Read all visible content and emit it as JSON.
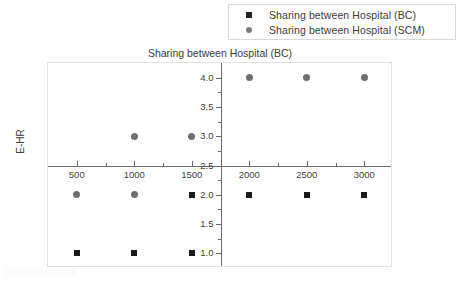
{
  "figure": {
    "title": "Sharing between Hospital (BC)",
    "y_axis_label": "E-HR"
  },
  "legend": {
    "entries": [
      {
        "label": "Sharing between Hospital (BC)",
        "marker": "square-marker-icon",
        "color": "#222222"
      },
      {
        "label": "Sharing between Hospital  (SCM)",
        "marker": "circle-marker-icon",
        "color": "#7d7d7d"
      }
    ]
  },
  "axes": {
    "x_tick_labels": [
      "500",
      "1000",
      "1500",
      "2000",
      "2500",
      "3000"
    ],
    "y_tick_labels": [
      "1.0",
      "1.5",
      "2.0",
      "2.5",
      "3.0",
      "3.5",
      "4.0"
    ]
  },
  "chart_data": {
    "type": "scatter",
    "title": "Sharing between Hospital (BC)",
    "xlabel": "",
    "ylabel": "E-HR",
    "xlim": [
      250,
      3250
    ],
    "ylim": [
      0.75,
      4.25
    ],
    "xticks": [
      500,
      1000,
      1500,
      2000,
      2500,
      3000
    ],
    "yticks": [
      1.0,
      1.5,
      2.0,
      2.5,
      3.0,
      3.5,
      4.0
    ],
    "grid": false,
    "legend_position": "top-right-outside",
    "spine_cross_x": 1750,
    "spine_cross_y": 2.5,
    "series": [
      {
        "name": "Sharing between Hospital (BC)",
        "marker": "square",
        "color": "#1a1a1a",
        "points": [
          {
            "x": 500,
            "y": 1.0
          },
          {
            "x": 1000,
            "y": 1.0
          },
          {
            "x": 1500,
            "y": 1.0
          },
          {
            "x": 1500,
            "y": 2.0
          },
          {
            "x": 2000,
            "y": 2.0
          },
          {
            "x": 2500,
            "y": 2.0
          },
          {
            "x": 3000,
            "y": 2.0
          }
        ]
      },
      {
        "name": "Sharing between Hospital  (SCM)",
        "marker": "circle",
        "color": "#6f6f6f",
        "points": [
          {
            "x": 500,
            "y": 2.0
          },
          {
            "x": 1000,
            "y": 2.0
          },
          {
            "x": 1000,
            "y": 3.0
          },
          {
            "x": 1500,
            "y": 3.0
          },
          {
            "x": 2000,
            "y": 4.0
          },
          {
            "x": 2500,
            "y": 4.0
          },
          {
            "x": 3000,
            "y": 4.0
          }
        ]
      }
    ]
  }
}
